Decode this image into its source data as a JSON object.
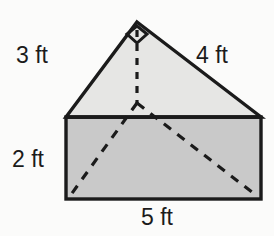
{
  "figure": {
    "kind": "triangular-prism-net-diagram",
    "colors": {
      "stroke": "#1b1b1b",
      "triangle_fill": "#e6e6e4",
      "rectangle_fill": "#c9c9c9",
      "background": "#fbfbfa",
      "dash_stroke": "#1b1b1b",
      "label_color": "#1b1b1b"
    },
    "labels": {
      "left_leg": "3 ft",
      "right_leg": "4 ft",
      "height": "2 ft",
      "base": "5 ft"
    },
    "geometry": {
      "apex": [
        137,
        22
      ],
      "triangle_left": [
        66,
        117
      ],
      "triangle_right": [
        261,
        117
      ],
      "rect_left": 66,
      "rect_right": 261,
      "rect_top": 117,
      "rect_bottom": 199,
      "dashed_vertex": [
        137,
        103
      ],
      "right_angle_marker": true
    }
  }
}
